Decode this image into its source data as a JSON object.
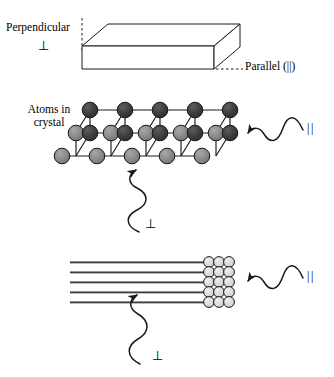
{
  "figure": {
    "background_color": "#ffffff",
    "line_color": "#1a1a1a",
    "labels": {
      "perpendicular": "Perpendicular",
      "parallel": "Parallel (||)",
      "atoms_in_crystal": "Atoms in\ncrystal",
      "perpendicular_symbol": "⊥",
      "parallel_symbol": "||"
    },
    "panels": [
      {
        "id": "slab",
        "name": "bulk-slab",
        "description": "3D rectangular slab drawn in oblique projection",
        "labels": [
          "Perpendicular",
          "⊥",
          "Parallel (||)"
        ]
      },
      {
        "id": "lattice",
        "name": "crystal-lattice",
        "description": "Cubic lattice of bonded atoms, 5 columns by 3 depth layers",
        "labels": [
          "Atoms in\ncrystal",
          "||",
          "⊥"
        ],
        "atom_colors": {
          "back_layer": "#3a3a3a",
          "middle_layer": "#4a4a4a",
          "front_layer": "#8c8c8c"
        },
        "columns": 5,
        "rows": 3
      },
      {
        "id": "fibers",
        "name": "aligned-fibers",
        "description": "Five aligned fibers shown edge-on with a packed circular cross-section at the right end",
        "labels": [
          "||",
          "⊥"
        ],
        "fiber_count": 5,
        "cross_section_color": "#dcdcdc",
        "cross_section_columns": 3,
        "cross_section_rows": 4
      }
    ],
    "waves": [
      {
        "id": "wave-parallel-lattice",
        "name": "incident-wave-parallel-lattice",
        "direction": "leftward-horizontal",
        "symbol": "||"
      },
      {
        "id": "wave-perpendicular-lattice",
        "name": "incident-wave-perpendicular-lattice",
        "direction": "upward-vertical",
        "symbol": "⊥"
      },
      {
        "id": "wave-parallel-fiber",
        "name": "incident-wave-parallel-fiber",
        "direction": "leftward-horizontal",
        "symbol": "||"
      },
      {
        "id": "wave-perpendicular-fiber",
        "name": "incident-wave-perpendicular-fiber",
        "direction": "upward-vertical",
        "symbol": "⊥"
      }
    ]
  }
}
